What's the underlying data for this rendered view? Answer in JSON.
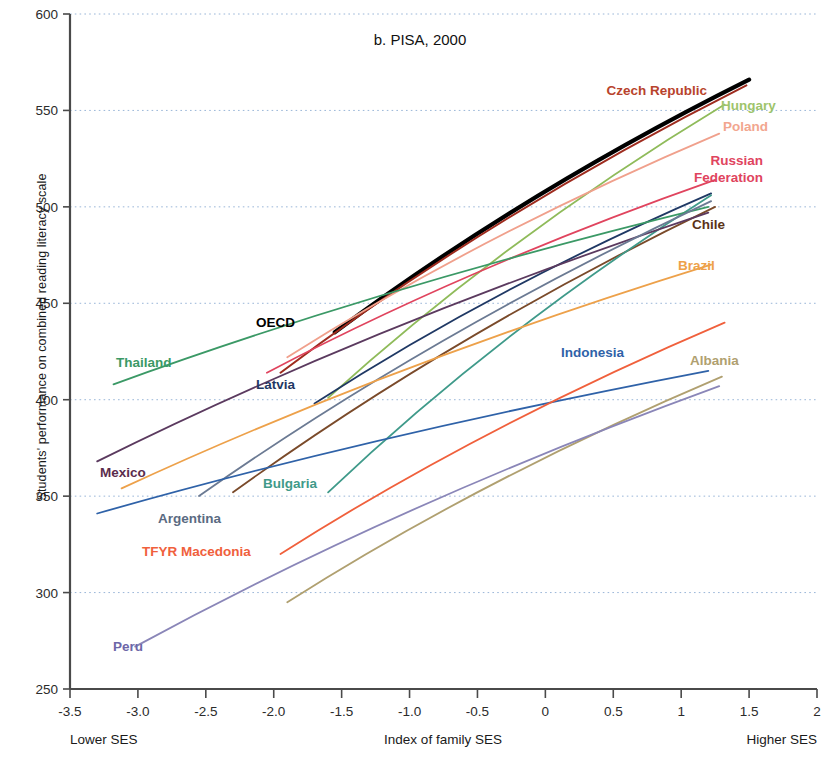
{
  "chart_data": {
    "type": "line",
    "title": "b. PISA, 2000",
    "xlabel": "Index of family SES",
    "ylabel": "Students' performance on combined reading literacy scale",
    "xlim": [
      -3.5,
      2
    ],
    "ylim": [
      250,
      600
    ],
    "grid": "horizontal-dotted",
    "legend": "inline-labels",
    "xticks": [
      "-3.5",
      "-3.0",
      "-2.5",
      "-2.0",
      "-1.5",
      "-1.0",
      "-0.5",
      "0",
      "0.5",
      "1",
      "1.5",
      "2"
    ],
    "xtickvalues": [
      -3.5,
      -3.0,
      -2.5,
      -2.0,
      -1.5,
      -1.0,
      -0.5,
      0,
      0.5,
      1,
      1.5,
      2
    ],
    "yticks": [
      "250",
      "300",
      "350",
      "400",
      "450",
      "500",
      "550",
      "600"
    ],
    "ytickvalues": [
      250,
      300,
      350,
      400,
      450,
      500,
      550,
      600
    ],
    "x_axis_end_labels": {
      "left": "Lower SES",
      "right": "Higher SES"
    },
    "series": [
      {
        "name": "OECD",
        "color": "#000000",
        "width": 4.2,
        "x": [
          -1.55,
          1.5
        ],
        "y": [
          435,
          566
        ],
        "label": {
          "text": "OECD",
          "x": 295,
          "y": 327,
          "anchor": "end",
          "color": "#000000"
        }
      },
      {
        "name": "Czech Republic",
        "color": "#9e2b1e",
        "width": 2.0,
        "x": [
          -1.95,
          1.48
        ],
        "y": [
          414,
          563
        ],
        "label": {
          "text": "Czech Republic",
          "x": 707,
          "y": 95,
          "anchor": "end",
          "color": "#b8432c"
        }
      },
      {
        "name": "Hungary",
        "color": "#8fbb5a",
        "width": 1.8,
        "x": [
          -1.6,
          1.32
        ],
        "y": [
          401,
          553
        ],
        "label": {
          "text": "Hungary",
          "x": 721,
          "y": 110,
          "anchor": "start",
          "color": "#9ec46b"
        }
      },
      {
        "name": "Poland",
        "color": "#f0a08c",
        "width": 1.8,
        "x": [
          -1.9,
          1.28
        ],
        "y": [
          422,
          538
        ],
        "label": {
          "text": "Poland",
          "x": 723,
          "y": 131,
          "anchor": "start",
          "color": "#f2a68f"
        }
      },
      {
        "name": "Russian Federation",
        "color": "#e0445e",
        "width": 1.8,
        "x": [
          -2.05,
          1.25
        ],
        "y": [
          414,
          514
        ],
        "label": {
          "text": "Russian",
          "x": 763,
          "y": 165,
          "anchor": "end",
          "color": "#e0445e"
        },
        "label2": {
          "text": "Federation",
          "x": 763,
          "y": 182,
          "anchor": "end",
          "color": "#e0445e"
        }
      },
      {
        "name": "Chile",
        "color": "#7a4a2a",
        "width": 1.8,
        "x": [
          -2.3,
          1.25
        ],
        "y": [
          352,
          500
        ],
        "label": {
          "text": "Chile",
          "x": 692,
          "y": 229,
          "anchor": "start",
          "color": "#5b3318"
        }
      },
      {
        "name": "Latvia",
        "color": "#1f3864",
        "width": 1.8,
        "x": [
          -1.7,
          1.22
        ],
        "y": [
          398,
          507
        ],
        "label": {
          "text": "Latvia",
          "x": 295,
          "y": 389,
          "anchor": "end",
          "color": "#1f3864"
        }
      },
      {
        "name": "Bulgaria",
        "color": "#3f9a8a",
        "width": 1.8,
        "x": [
          -1.6,
          1.22
        ],
        "y": [
          352,
          506
        ],
        "label": {
          "text": "Bulgaria",
          "x": 263,
          "y": 488,
          "anchor": "start",
          "color": "#3f9a8a"
        }
      },
      {
        "name": "Thailand",
        "color": "#3b9966",
        "width": 1.8,
        "x": [
          -3.18,
          1.2
        ],
        "y": [
          408,
          500
        ],
        "label": {
          "text": "Thailand",
          "x": 116,
          "y": 367,
          "anchor": "start",
          "color": "#3b9966"
        }
      },
      {
        "name": "Mexico",
        "color": "#5b3a5f",
        "width": 1.8,
        "x": [
          -3.3,
          1.2
        ],
        "y": [
          368,
          497
        ],
        "label": {
          "text": "Mexico",
          "x": 100,
          "y": 477,
          "anchor": "start",
          "color": "#5b2d4d"
        }
      },
      {
        "name": "Argentina",
        "color": "#6b7a93",
        "width": 1.8,
        "x": [
          -2.55,
          1.22
        ],
        "y": [
          350,
          503
        ],
        "label": {
          "text": "Argentina",
          "x": 158,
          "y": 523,
          "anchor": "start",
          "color": "#5a6b82"
        }
      },
      {
        "name": "Brazil",
        "color": "#eda14a",
        "width": 1.8,
        "x": [
          -3.12,
          1.22
        ],
        "y": [
          354,
          470
        ],
        "label": {
          "text": "Brazil",
          "x": 678,
          "y": 270,
          "anchor": "start",
          "color": "#eda14a"
        }
      },
      {
        "name": "Indonesia",
        "color": "#2f62a8",
        "width": 1.8,
        "x": [
          -3.3,
          1.2
        ],
        "y": [
          341,
          415
        ],
        "label": {
          "text": "Indonesia",
          "x": 561,
          "y": 357,
          "anchor": "start",
          "color": "#2f62a8"
        }
      },
      {
        "name": "TFYR Macedonia",
        "color": "#f0603c",
        "width": 1.8,
        "x": [
          -1.95,
          1.32
        ],
        "y": [
          320,
          440
        ],
        "label": {
          "text": "TFYR Macedonia",
          "x": 142,
          "y": 556,
          "anchor": "start",
          "color": "#f0603c"
        }
      },
      {
        "name": "Albania",
        "color": "#b0a070",
        "width": 1.8,
        "x": [
          -1.9,
          1.3
        ],
        "y": [
          295,
          412
        ],
        "label": {
          "text": "Albania",
          "x": 690,
          "y": 365,
          "anchor": "start",
          "color": "#b0a070"
        }
      },
      {
        "name": "Peru",
        "color": "#8a86b8",
        "width": 1.8,
        "x": [
          -3.02,
          1.28
        ],
        "y": [
          272,
          407
        ],
        "label": {
          "text": "Peru",
          "x": 113,
          "y": 651,
          "anchor": "start",
          "color": "#6d67a8"
        }
      }
    ]
  }
}
